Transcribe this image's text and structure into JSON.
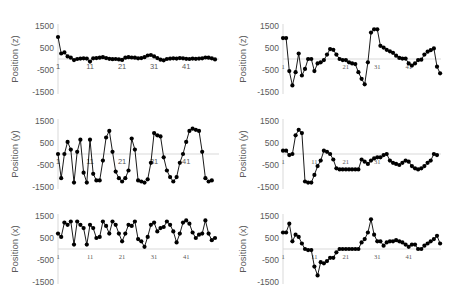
{
  "chart_data": [
    {
      "type": "line",
      "panel": "top-left",
      "ylabel": "Position (z)",
      "yticks": [
        1500,
        500,
        -500,
        -1500
      ],
      "xticks": [
        1,
        11,
        21,
        31,
        41
      ],
      "ylim": [
        -1500,
        1500
      ],
      "x": [
        1,
        2,
        3,
        4,
        5,
        6,
        7,
        8,
        9,
        10,
        11,
        12,
        13,
        14,
        15,
        16,
        17,
        18,
        19,
        20,
        21,
        22,
        23,
        24,
        25,
        26,
        27,
        28,
        29,
        30,
        31,
        32,
        33,
        34,
        35,
        36,
        37,
        38,
        39,
        40,
        41,
        42,
        43,
        44,
        45,
        46,
        47,
        48,
        49,
        50
      ],
      "values": [
        1000,
        250,
        300,
        120,
        60,
        -50,
        0,
        20,
        30,
        20,
        -120,
        30,
        40,
        60,
        80,
        40,
        10,
        -10,
        0,
        -20,
        -40,
        60,
        80,
        70,
        60,
        30,
        40,
        80,
        160,
        180,
        120,
        40,
        -30,
        -60,
        0,
        20,
        30,
        20,
        40,
        30,
        10,
        0,
        20,
        10,
        20,
        30,
        70,
        60,
        30,
        -20
      ]
    },
    {
      "type": "line",
      "panel": "top-right",
      "ylabel": "Position (z)",
      "yticks": [
        1500,
        500,
        -500,
        -1500
      ],
      "xticks": [
        1,
        21,
        31,
        41
      ],
      "ylim": [
        -1500,
        1500
      ],
      "x": [
        1,
        2,
        3,
        4,
        5,
        6,
        7,
        8,
        9,
        10,
        11,
        12,
        13,
        14,
        15,
        16,
        17,
        18,
        19,
        20,
        21,
        22,
        23,
        24,
        25,
        26,
        27,
        28,
        29,
        30,
        31,
        32,
        33,
        34,
        35,
        36,
        37,
        38,
        39,
        40,
        41,
        42,
        43,
        44,
        45,
        46,
        47,
        48,
        49,
        50
      ],
      "values": [
        950,
        950,
        -550,
        -1200,
        -600,
        250,
        -750,
        -450,
        0,
        0,
        -550,
        -200,
        -150,
        -50,
        200,
        450,
        420,
        200,
        0,
        -50,
        -50,
        -150,
        -200,
        -230,
        -600,
        -900,
        -1150,
        -150,
        1200,
        1350,
        1350,
        600,
        520,
        420,
        350,
        280,
        150,
        50,
        20,
        20,
        -200,
        -300,
        -200,
        -50,
        -30,
        200,
        330,
        400,
        480,
        -350,
        -650
      ]
    },
    {
      "type": "line",
      "panel": "middle-left",
      "ylabel": "Position (y)",
      "yticks": [
        1500,
        500,
        -500,
        -1500
      ],
      "xticks": [
        1,
        11,
        21,
        31,
        41
      ],
      "ylim": [
        -1500,
        1500
      ],
      "x": [
        1,
        2,
        3,
        4,
        5,
        6,
        7,
        8,
        9,
        10,
        11,
        12,
        13,
        14,
        15,
        16,
        17,
        18,
        19,
        20,
        21,
        22,
        23,
        24,
        25,
        26,
        27,
        28,
        29,
        30,
        31,
        32,
        33,
        34,
        35,
        36,
        37,
        38,
        39,
        40,
        41,
        42,
        43,
        44,
        45,
        46,
        47,
        48,
        49,
        50
      ],
      "values": [
        0,
        -1100,
        0,
        550,
        200,
        -1300,
        100,
        650,
        -850,
        -1300,
        650,
        -900,
        -1200,
        -1200,
        -300,
        750,
        1050,
        100,
        -800,
        -1100,
        -1250,
        -1100,
        -750,
        700,
        200,
        -1200,
        -1250,
        -1300,
        -1150,
        -400,
        950,
        850,
        800,
        -150,
        -750,
        -1050,
        -1250,
        -1050,
        -400,
        0,
        550,
        1050,
        1150,
        1100,
        1050,
        100,
        -1100,
        -1250,
        -1200
      ]
    },
    {
      "type": "line",
      "panel": "middle-right",
      "ylabel": "Position (y)",
      "yticks": [
        1500,
        500,
        -500,
        -1500
      ],
      "xticks": [
        1,
        11,
        21,
        31
      ],
      "ylim": [
        -1500,
        1500
      ],
      "x": [
        1,
        2,
        3,
        4,
        5,
        6,
        7,
        8,
        9,
        10,
        11,
        12,
        13,
        14,
        15,
        16,
        17,
        18,
        19,
        20,
        21,
        22,
        23,
        24,
        25,
        26,
        27,
        28,
        29,
        30,
        31,
        32,
        33,
        34,
        35,
        36,
        37,
        38,
        39,
        40,
        41,
        42,
        43,
        44,
        45,
        46,
        47,
        48,
        49,
        50
      ],
      "values": [
        150,
        150,
        -50,
        0,
        850,
        1100,
        950,
        -1250,
        -1300,
        -1300,
        -950,
        -550,
        -300,
        150,
        100,
        0,
        -250,
        -650,
        -700,
        -700,
        -700,
        -700,
        -700,
        -700,
        -700,
        -250,
        -350,
        -450,
        -300,
        -200,
        -150,
        -150,
        -50,
        0,
        -300,
        -400,
        -450,
        -500,
        -400,
        -300,
        -350,
        -550,
        -650,
        -700,
        -650,
        -550,
        -400,
        -300,
        0,
        -50
      ]
    },
    {
      "type": "line",
      "panel": "bottom-left",
      "ylabel": "Position (x)",
      "yticks": [
        1500,
        500,
        -500,
        -1500
      ],
      "xticks": [
        1,
        11,
        21,
        31,
        41
      ],
      "ylim": [
        -1500,
        1500
      ],
      "x": [
        1,
        2,
        3,
        4,
        5,
        6,
        7,
        8,
        9,
        10,
        11,
        12,
        13,
        14,
        15,
        16,
        17,
        18,
        19,
        20,
        21,
        22,
        23,
        24,
        25,
        26,
        27,
        28,
        29,
        30,
        31,
        32,
        33,
        34,
        35,
        36,
        37,
        38,
        39,
        40,
        41,
        42,
        43,
        44,
        45,
        46,
        47,
        48,
        49,
        50
      ],
      "values": [
        700,
        550,
        1200,
        1100,
        1250,
        200,
        1250,
        1100,
        950,
        200,
        1100,
        950,
        500,
        550,
        1250,
        1050,
        700,
        1250,
        1100,
        700,
        350,
        700,
        1100,
        1050,
        1250,
        450,
        350,
        100,
        550,
        1100,
        1200,
        800,
        950,
        1000,
        1250,
        1100,
        800,
        300,
        700,
        1200,
        1300,
        1150,
        750,
        500,
        650,
        700,
        1300,
        700,
        400,
        500
      ]
    },
    {
      "type": "line",
      "panel": "bottom-right",
      "ylabel": "Position (x)",
      "yticks": [
        1500,
        500,
        -500,
        -1500
      ],
      "xticks": [
        1,
        11,
        21,
        31,
        41
      ],
      "ylim": [
        -1500,
        1500
      ],
      "x": [
        1,
        2,
        3,
        4,
        5,
        6,
        7,
        8,
        9,
        10,
        11,
        12,
        13,
        14,
        15,
        16,
        17,
        18,
        19,
        20,
        21,
        22,
        23,
        24,
        25,
        26,
        27,
        28,
        29,
        30,
        31,
        32,
        33,
        34,
        35,
        36,
        37,
        38,
        39,
        40,
        41,
        42,
        43,
        44,
        45,
        46,
        47,
        48,
        49,
        50
      ],
      "values": [
        750,
        750,
        1150,
        350,
        650,
        550,
        250,
        0,
        -50,
        -50,
        -800,
        -1200,
        -600,
        -650,
        -550,
        -400,
        -400,
        -150,
        0,
        0,
        0,
        0,
        0,
        0,
        0,
        300,
        450,
        750,
        1350,
        650,
        350,
        350,
        150,
        300,
        350,
        350,
        400,
        350,
        300,
        200,
        100,
        200,
        200,
        0,
        0,
        150,
        250,
        350,
        450,
        600,
        250
      ]
    }
  ]
}
